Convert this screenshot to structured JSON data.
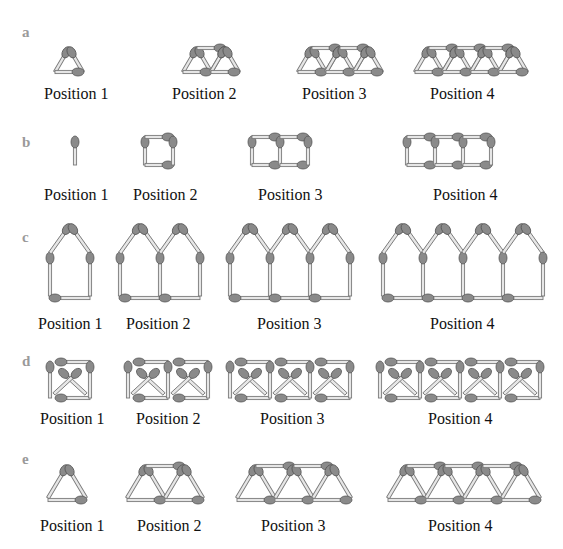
{
  "colors": {
    "stick_fill": "#e6e6e6",
    "stick_stroke": "#7a7a7a",
    "head_fill": "#8a8a8a",
    "head_stroke": "#555555",
    "row_label": "#9a9a9a",
    "text": "#111111"
  },
  "rows": [
    {
      "id": "a",
      "label": "a",
      "shape": "triangle-strip",
      "positions": [
        "Position 1",
        "Position 2",
        "Position 3",
        "Position 4"
      ]
    },
    {
      "id": "b",
      "label": "b",
      "shape": "square-chain",
      "positions": [
        "Position 1",
        "Position 2",
        "Position 3",
        "Position 4"
      ]
    },
    {
      "id": "c",
      "label": "c",
      "shape": "house-chain",
      "positions": [
        "Position 1",
        "Position 2",
        "Position 3",
        "Position 4"
      ]
    },
    {
      "id": "d",
      "label": "d",
      "shape": "crossed-square-chain",
      "positions": [
        "Position 1",
        "Position 2",
        "Position 3",
        "Position 4"
      ]
    },
    {
      "id": "e",
      "label": "e",
      "shape": "triangle-truss",
      "positions": [
        "Position 1",
        "Position 2",
        "Position 3",
        "Position 4"
      ]
    }
  ]
}
